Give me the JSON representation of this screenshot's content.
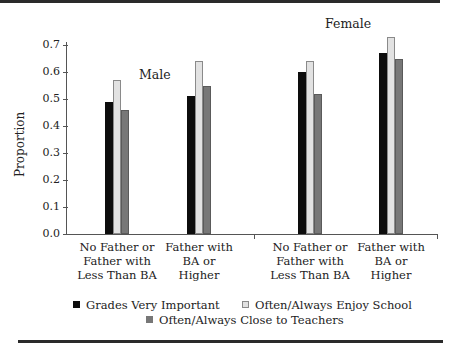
{
  "chart_data": {
    "type": "bar",
    "title": "",
    "xlabel": "",
    "ylabel": "Proportion",
    "ylim": [
      0,
      0.7
    ],
    "yticks": [
      "0.0",
      "0.1",
      "0.2",
      "0.3",
      "0.4",
      "0.5",
      "0.6",
      "0.7"
    ],
    "groups": [
      "Male",
      "Female"
    ],
    "categories": [
      "No Father or\nFather with\nLess Than BA",
      "Father with\nBA or\nHigher",
      "No Father or\nFather with\nLess Than BA",
      "Father with\nBA or\nHigher"
    ],
    "category_group": [
      "Male",
      "Male",
      "Female",
      "Female"
    ],
    "series": [
      {
        "name": "Grades Very Important",
        "color": "#0d0d0d",
        "values": [
          0.49,
          0.51,
          0.6,
          0.67
        ]
      },
      {
        "name": "Often/Always Enjoy School",
        "color": "#e2e2e2",
        "values": [
          0.57,
          0.64,
          0.64,
          0.73
        ]
      },
      {
        "name": "Often/Always Close to Teachers",
        "color": "#777777",
        "values": [
          0.46,
          0.55,
          0.52,
          0.65
        ]
      }
    ],
    "grid": false,
    "legend_position": "bottom"
  }
}
